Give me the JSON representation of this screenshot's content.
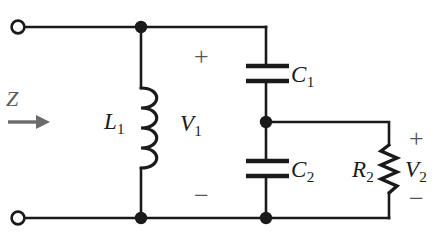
{
  "figure": {
    "kind": "circuit-diagram",
    "width": 443,
    "height": 239,
    "background_color": "#ffffff",
    "wire_color": "#1a1a1a",
    "annotation_color": "#555555"
  },
  "labels": {
    "impedance": {
      "symbol": "Z",
      "subscript": ""
    },
    "inductor": {
      "symbol": "L",
      "subscript": "1"
    },
    "voltage_in": {
      "symbol": "V",
      "subscript": "1"
    },
    "capacitor_1": {
      "symbol": "C",
      "subscript": "1"
    },
    "capacitor_2": {
      "symbol": "C",
      "subscript": "2"
    },
    "resistor": {
      "symbol": "R",
      "subscript": "2"
    },
    "voltage_out": {
      "symbol": "V",
      "subscript": "2"
    }
  },
  "polarity": {
    "v1_plus": "+",
    "v1_minus": "−",
    "v2_plus": "+",
    "v2_minus": "−"
  },
  "components": [
    {
      "id": "L1",
      "type": "inductor",
      "label": "L1",
      "orientation": "vertical"
    },
    {
      "id": "C1",
      "type": "capacitor",
      "label": "C1",
      "orientation": "vertical"
    },
    {
      "id": "C2",
      "type": "capacitor",
      "label": "C2",
      "orientation": "vertical"
    },
    {
      "id": "R2",
      "type": "resistor",
      "label": "R2",
      "orientation": "vertical"
    }
  ],
  "terminals": [
    {
      "id": "in-top",
      "style": "open-circle"
    },
    {
      "id": "in-bottom",
      "style": "open-circle"
    }
  ],
  "nodes": [
    {
      "id": "node-top-left",
      "style": "filled-dot"
    },
    {
      "id": "node-bottom-left",
      "style": "filled-dot"
    },
    {
      "id": "node-mid",
      "style": "filled-dot"
    },
    {
      "id": "node-bottom-mid",
      "style": "filled-dot"
    }
  ]
}
